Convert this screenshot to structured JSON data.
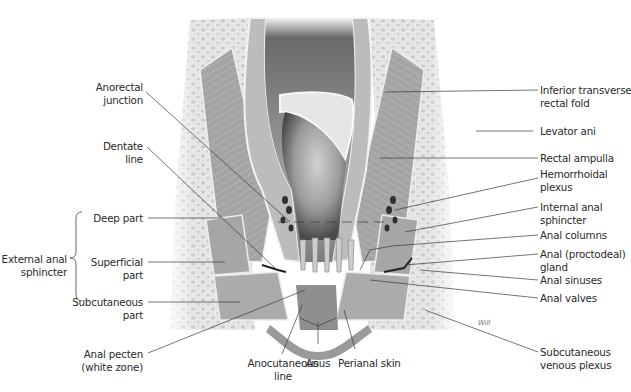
{
  "figure": {
    "signature": "Will"
  },
  "labels_left": {
    "anorectal_junction": [
      "Anorectal",
      "junction"
    ],
    "dentate_line": [
      "Dentate",
      "line"
    ],
    "external_anal_sphincter": [
      "External anal",
      "sphincter"
    ],
    "deep_part": [
      "Deep part"
    ],
    "superficial_part": [
      "Superficial",
      "part"
    ],
    "subcutaneous_part": [
      "Subcutaneous",
      "part"
    ],
    "anal_pecten": [
      "Anal pecten",
      "(white zone)"
    ]
  },
  "labels_bottom": {
    "anocutaneous_line": [
      "Anocutaneous",
      "line"
    ],
    "anus": [
      "Anus"
    ],
    "perianal_skin": [
      "Perianal skin"
    ]
  },
  "labels_right": {
    "inferior_transverse_rectal_fold": [
      "Inferior transverse",
      "rectal fold"
    ],
    "levator_ani": [
      "Levator ani"
    ],
    "rectal_ampulla": [
      "Rectal ampulla"
    ],
    "hemorrhoidal_plexus": [
      "Hemorrhoidal",
      "plexus"
    ],
    "internal_anal_sphincter": [
      "Internal anal",
      "sphincter"
    ],
    "anal_columns": [
      "Anal columns"
    ],
    "anal_gland": [
      "Anal (proctodeal)",
      "gland"
    ],
    "anal_sinuses": [
      "Anal sinuses"
    ],
    "anal_valves": [
      "Anal valves"
    ],
    "subcutaneous_venous_plexus": [
      "Subcutaneous",
      "venous plexus"
    ]
  },
  "colors": {
    "background": "#ffffff",
    "leader_line": "#3a3a3a",
    "label_text": "#2a2a2a",
    "tissue_light": "#d4d4d4",
    "muscle": "#9a9a9a",
    "lumen_dark": "#3c3c3c"
  }
}
